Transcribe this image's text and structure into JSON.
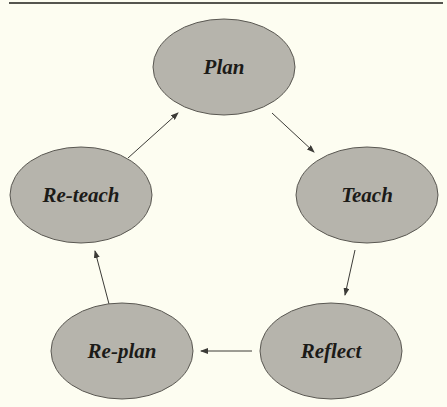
{
  "diagram": {
    "type": "cycle",
    "colors": {
      "background": "#fdfdf1",
      "node_fill": "#b6b4ac",
      "node_stroke": "#5a5852",
      "text": "#1c1b18",
      "edge": "#3c3b37",
      "top_rule": "#55554f"
    },
    "nodes": [
      {
        "id": "plan",
        "label": "Plan",
        "cx": 224,
        "cy": 67,
        "rx": 71,
        "ry": 48
      },
      {
        "id": "teach",
        "label": "Teach",
        "cx": 367,
        "cy": 195,
        "rx": 71,
        "ry": 48
      },
      {
        "id": "reflect",
        "label": "Reflect",
        "cx": 331,
        "cy": 351,
        "rx": 71,
        "ry": 48
      },
      {
        "id": "re-plan",
        "label": "Re-plan",
        "cx": 122,
        "cy": 351,
        "rx": 71,
        "ry": 48
      },
      {
        "id": "re-teach",
        "label": "Re-teach",
        "cx": 81,
        "cy": 195,
        "rx": 71,
        "ry": 48
      }
    ],
    "edges": [
      {
        "from": "plan",
        "to": "teach",
        "x1": 272,
        "y1": 113,
        "x2": 314,
        "y2": 152
      },
      {
        "from": "teach",
        "to": "reflect",
        "x1": 355,
        "y1": 250,
        "x2": 345,
        "y2": 295
      },
      {
        "from": "reflect",
        "to": "re-plan",
        "x1": 252,
        "y1": 351,
        "x2": 201,
        "y2": 351
      },
      {
        "from": "re-plan",
        "to": "re-teach",
        "x1": 109,
        "y1": 304,
        "x2": 95,
        "y2": 251
      },
      {
        "from": "re-teach",
        "to": "plan",
        "x1": 128,
        "y1": 158,
        "x2": 178,
        "y2": 113
      }
    ]
  }
}
